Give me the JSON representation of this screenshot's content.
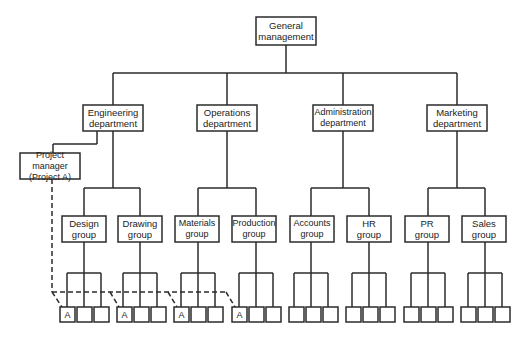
{
  "diagram": {
    "root": {
      "line1": "General",
      "line2": "management"
    },
    "departments": [
      {
        "line1": "Engineering",
        "line2": "department"
      },
      {
        "line1": "Operations",
        "line2": "department"
      },
      {
        "line1": "Administration",
        "line2": "department"
      },
      {
        "line1": "Marketing",
        "line2": "department"
      }
    ],
    "project_manager": {
      "line1": "Project manager",
      "line2": "(Project A)"
    },
    "groups": [
      {
        "line1": "Design",
        "line2": "group"
      },
      {
        "line1": "Drawing",
        "line2": "group"
      },
      {
        "line1": "Materials",
        "line2": "group"
      },
      {
        "line1": "Production",
        "line2": "group"
      },
      {
        "line1": "Accounts",
        "line2": "group"
      },
      {
        "line1": "HR",
        "line2": "group"
      },
      {
        "line1": "PR",
        "line2": "group"
      },
      {
        "line1": "Sales",
        "line2": "group"
      }
    ],
    "member_label": "A",
    "members_per_group": 3,
    "project_a_groups": [
      "Design group",
      "Drawing group",
      "Materials group",
      "Production group"
    ],
    "colors": {
      "line": "#2b2b2b",
      "background": "#ffffff",
      "text": "#222222"
    }
  }
}
